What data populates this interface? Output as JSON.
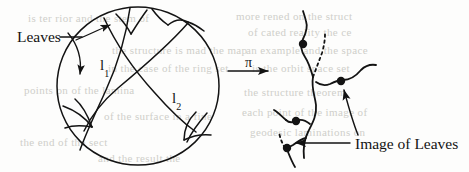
{
  "figure": {
    "background_color": "#fdfdfc",
    "ink_color": "#131313"
  },
  "left_panel": {
    "name": "poincare-disk",
    "description": "Circle (disk) containing geodesic arcs forming a lamination with leaf regions near the boundary",
    "disk": {
      "center_x": 138,
      "center_y": 86,
      "radius_x": 81,
      "radius_y": 79
    },
    "geodesic_labels": [
      {
        "id": "l1",
        "text": "l",
        "subscript": "1"
      },
      {
        "id": "l2",
        "text": "l",
        "subscript": "2"
      }
    ],
    "annotation": {
      "label": "Leaves",
      "arrow_count": 2,
      "arrow_targets": [
        "upper boundary leaf region",
        "left boundary leaf region"
      ]
    }
  },
  "map_arrow": {
    "name": "projection-arrow",
    "label": "π",
    "direction": "right"
  },
  "right_panel": {
    "name": "image-graph",
    "description": "Tree-like graph image of the lamination with marked vertex points and dashed edges",
    "marked_points": 4,
    "dashed_edges": 2,
    "annotation": {
      "label": "Image of Leaves",
      "arrow_count": 2,
      "arrow_targets": [
        "upper right vertex",
        "lower left vertex"
      ]
    }
  },
  "bleed_through_text": [
    {
      "text": "is ter  rior  and  the  stem  of",
      "x": 28,
      "y": 12
    },
    {
      "text": "more  rened  on the  struct",
      "x": 236,
      "y": 10
    },
    {
      "text": "of  cated  reality  the  ce",
      "x": 248,
      "y": 26
    },
    {
      "text": "the  structure  is  mad  the  map",
      "x": 112,
      "y": 44
    },
    {
      "text": "an  example  and  the  space",
      "x": 246,
      "y": 44
    },
    {
      "text": "in  the  case  of  the  ring  set",
      "x": 108,
      "y": 62
    },
    {
      "text": "is  the  orbit  space  set",
      "x": 252,
      "y": 62
    },
    {
      "text": "points  on  of  the  lamina",
      "x": 24,
      "y": 84
    },
    {
      "text": "the  structure  theorem",
      "x": 244,
      "y": 86
    },
    {
      "text": "of  the  surface  in  a  fine",
      "x": 104,
      "y": 110
    },
    {
      "text": "each  point  of  the  image  of",
      "x": 242,
      "y": 106
    },
    {
      "text": "geodesic  laminations  on",
      "x": 250,
      "y": 126
    },
    {
      "text": "the  end  of  the  sect",
      "x": 20,
      "y": 136
    },
    {
      "text": "and  the  result  the",
      "x": 98,
      "y": 152
    }
  ]
}
